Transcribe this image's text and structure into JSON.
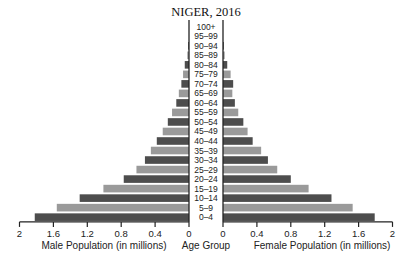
{
  "chart_data": {
    "type": "bar",
    "subtype": "population-pyramid",
    "title": "NIGER, 2016",
    "categories": [
      "100+",
      "95–99",
      "90–94",
      "85–89",
      "80–84",
      "75–79",
      "70–74",
      "65–69",
      "60–64",
      "55–59",
      "50–54",
      "45–49",
      "40–44",
      "35–39",
      "30–34",
      "25–29",
      "20–24",
      "15–19",
      "10–14",
      "5–9",
      "0–4"
    ],
    "series": [
      {
        "name": "Male Population (in millions)",
        "side": "left",
        "values": [
          0.0,
          0.0,
          0.01,
          0.02,
          0.05,
          0.07,
          0.09,
          0.12,
          0.15,
          0.2,
          0.25,
          0.31,
          0.38,
          0.45,
          0.52,
          0.62,
          0.77,
          1.01,
          1.29,
          1.56,
          1.82
        ]
      },
      {
        "name": "Female Population (in millions)",
        "side": "right",
        "values": [
          0.0,
          0.0,
          0.01,
          0.02,
          0.05,
          0.09,
          0.12,
          0.11,
          0.14,
          0.18,
          0.24,
          0.29,
          0.35,
          0.45,
          0.53,
          0.64,
          0.8,
          1.01,
          1.28,
          1.53,
          1.79
        ]
      }
    ],
    "xlabel_left": "Male Population (in millions)",
    "xlabel_center": "Age Group",
    "xlabel_right": "Female Population (in millions)",
    "ticks_left": [
      "2",
      "1.6",
      "1.2",
      "0.8",
      "0.4",
      "0"
    ],
    "ticks_right": [
      "0",
      "0.4",
      "0.8",
      "1.2",
      "1.6",
      "2"
    ],
    "xlim": [
      0,
      2
    ],
    "grid": false,
    "colors": {
      "dark": "#4d4d4d",
      "light": "#9a9a9a",
      "axis": "#222222"
    }
  }
}
